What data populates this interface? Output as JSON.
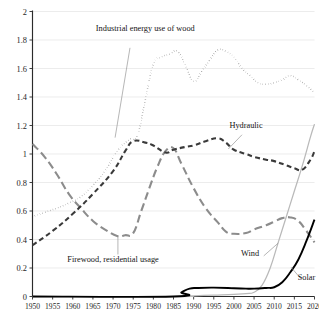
{
  "figure": {
    "ghost_text": "",
    "background": "#ffffff",
    "axis_color": "#2b2b2b",
    "grid_color": "#e4e4e4"
  },
  "chart_data": {
    "type": "line",
    "title": "",
    "subtitle": "",
    "xlabel": "",
    "ylabel": "",
    "xlim": [
      1950,
      2020
    ],
    "ylim": [
      0,
      2
    ],
    "grid": true,
    "legend_position": "inline-annotations",
    "x_ticks": [
      1950,
      1955,
      1960,
      1965,
      1970,
      1975,
      1980,
      1985,
      1990,
      1995,
      2000,
      2005,
      2010,
      2015,
      2020
    ],
    "x_tick_labels": [
      "1950",
      "1955",
      "1960",
      "1965",
      "1970",
      "1975",
      "1980",
      "1985",
      "1990",
      "1995",
      "2000",
      "2005",
      "2010",
      "2015",
      "2020"
    ],
    "y_ticks": [
      0,
      0.2,
      0.4,
      0.6,
      0.8,
      1,
      1.2,
      1.4,
      1.6,
      1.8,
      2
    ],
    "y_tick_labels": [
      "0",
      "0.2",
      "0.4",
      "0.6",
      "0.8",
      "1",
      "1.2",
      "1.4",
      "1.6",
      "1.8",
      "2"
    ],
    "series": [
      {
        "name": "Industrial energy use of wood",
        "label": "Industrial energy use of wood",
        "style": "dotted",
        "color": "#1a1a1a",
        "width": 1.5,
        "dash": "0.2,2.5",
        "x": [
          1950,
          1953,
          1956,
          1959,
          1962,
          1965,
          1968,
          1971,
          1974,
          1976,
          1978,
          1980,
          1982,
          1984,
          1986,
          1988,
          1990,
          1992,
          1994,
          1996,
          1998,
          2000,
          2002,
          2004,
          2006,
          2008,
          2010,
          2012,
          2014,
          2016,
          2018,
          2020
        ],
        "values": [
          0.56,
          0.59,
          0.62,
          0.655,
          0.7,
          0.78,
          0.88,
          1.02,
          1.1,
          1.13,
          1.38,
          1.63,
          1.68,
          1.7,
          1.72,
          1.62,
          1.51,
          1.58,
          1.66,
          1.73,
          1.72,
          1.68,
          1.6,
          1.55,
          1.5,
          1.49,
          1.5,
          1.52,
          1.55,
          1.52,
          1.48,
          1.43
        ]
      },
      {
        "name": "Hydraulic",
        "label": "Hydraulic",
        "style": "dashed",
        "color": "#3a3a3a",
        "width": 2.1,
        "dash": "5,3.2",
        "x": [
          1950,
          1955,
          1960,
          1965,
          1970,
          1973,
          1975,
          1978,
          1980,
          1983,
          1985,
          1988,
          1990,
          1993,
          1996,
          1998,
          2000,
          2003,
          2005,
          2008,
          2010,
          2013,
          2015,
          2017,
          2019,
          2020
        ],
        "values": [
          0.36,
          0.46,
          0.58,
          0.72,
          0.88,
          1.02,
          1.09,
          1.08,
          1.06,
          1.01,
          1.03,
          1.05,
          1.06,
          1.09,
          1.11,
          1.08,
          1.03,
          1.0,
          0.98,
          0.96,
          0.95,
          0.92,
          0.9,
          0.89,
          0.96,
          1.02
        ]
      },
      {
        "name": "Firewood, residential usage",
        "label": "Firewood, residential usage",
        "style": "long-dash",
        "color": "#8c8c8c",
        "width": 2.1,
        "dash": "8,4",
        "x": [
          1950,
          1953,
          1956,
          1959,
          1962,
          1965,
          1968,
          1971,
          1973,
          1975,
          1977,
          1979,
          1981,
          1983,
          1985,
          1987,
          1990,
          1993,
          1996,
          1998,
          2000,
          2003,
          2005,
          2008,
          2010,
          2012,
          2014,
          2016,
          2018,
          2020
        ],
        "values": [
          1.07,
          0.98,
          0.86,
          0.72,
          0.62,
          0.53,
          0.47,
          0.425,
          0.43,
          0.445,
          0.6,
          0.76,
          0.91,
          1.02,
          1.04,
          0.93,
          0.76,
          0.62,
          0.52,
          0.455,
          0.44,
          0.445,
          0.47,
          0.5,
          0.525,
          0.55,
          0.555,
          0.53,
          0.46,
          0.38
        ]
      },
      {
        "name": "Wind",
        "label": "Wind",
        "style": "solid-thin",
        "color": "#b9b9b9",
        "width": 1.25,
        "dash": "",
        "x": [
          1950,
          1985,
          1990,
          1995,
          2000,
          2003,
          2005,
          2007,
          2009,
          2011,
          2013,
          2015,
          2017,
          2019,
          2020
        ],
        "values": [
          0.0,
          0.0,
          0.005,
          0.01,
          0.015,
          0.02,
          0.03,
          0.08,
          0.2,
          0.38,
          0.56,
          0.74,
          0.92,
          1.12,
          1.21
        ]
      },
      {
        "name": "Solar",
        "label": "Solar",
        "style": "solid",
        "color": "#000000",
        "width": 1.9,
        "dash": "",
        "x": [
          1950,
          1985,
          1987,
          1989,
          1991,
          1995,
          2000,
          2003,
          2005,
          2008,
          2010,
          2012,
          2014,
          2016,
          2018,
          2020
        ],
        "values": [
          0.0,
          0.0,
          0.03,
          0.055,
          0.06,
          0.062,
          0.058,
          0.055,
          0.055,
          0.06,
          0.065,
          0.1,
          0.17,
          0.26,
          0.39,
          0.54
        ]
      }
    ],
    "annotations": [
      {
        "name": "industrial-wood-label",
        "text": "Industrial energy use of wood",
        "x": 1978,
        "y": 1.86,
        "anchor": "middle",
        "leader": true
      },
      {
        "name": "hydraulic-label",
        "text": "Hydraulic",
        "x": 2003,
        "y": 1.185,
        "anchor": "middle",
        "leader": true
      },
      {
        "name": "firewood-label",
        "text": "Firewood, residential usage",
        "x": 1970,
        "y": 0.245,
        "anchor": "middle",
        "leader": true
      },
      {
        "name": "wind-label",
        "text": "Wind",
        "x": 2004,
        "y": 0.285,
        "anchor": "middle",
        "leader": true
      },
      {
        "name": "solar-label",
        "text": "Solar",
        "x": 2018,
        "y": 0.115,
        "anchor": "middle",
        "leader": true
      }
    ]
  }
}
